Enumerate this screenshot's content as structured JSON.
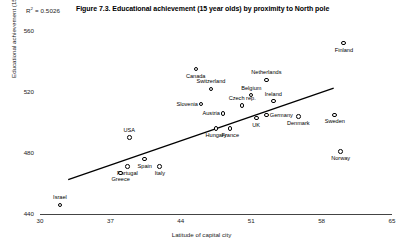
{
  "header": {
    "r2_prefix": "R",
    "r2_sup": "2",
    "r2_value": " = 0.5026",
    "title": "Figure 7.3. Educational achievement (15 year olds) by proximity to North pole"
  },
  "chart_data": {
    "type": "scatter",
    "title": "Figure 7.3. Educational achievement (15 year olds) by proximity to North pole",
    "xlabel": "Latitude of capital city",
    "ylabel": "Educational achievement (15 year olds)",
    "xlim": [
      30,
      65
    ],
    "ylim": [
      440,
      560
    ],
    "xticks": [
      "30",
      "37",
      "44",
      "51",
      "58",
      "65"
    ],
    "yticks": [
      "440",
      "480",
      "520",
      "560"
    ],
    "grid": false,
    "legend": "none",
    "annotations": [
      {
        "text": "R2 = 0.5026",
        "position": "top-left"
      }
    ],
    "trendline": {
      "visible": true,
      "x_start": 32.8,
      "y_start": 462.5,
      "x_end": 59.2,
      "y_end": 522.5
    },
    "points": [
      {
        "label": "Finland",
        "x": 60.2,
        "y": 552,
        "label_pos": "below"
      },
      {
        "label": "Canada",
        "x": 45.5,
        "y": 535,
        "label_pos": "below"
      },
      {
        "label": "Netherlands",
        "x": 52.5,
        "y": 528,
        "label_pos": "above"
      },
      {
        "label": "Switzerland",
        "x": 47.0,
        "y": 522,
        "label_pos": "above"
      },
      {
        "label": "Belgium",
        "x": 51.0,
        "y": 518,
        "label_pos": "above"
      },
      {
        "label": "Ireland",
        "x": 53.2,
        "y": 514,
        "label_pos": "above"
      },
      {
        "label": "Slovenia",
        "x": 46.0,
        "y": 512,
        "label_pos": "left"
      },
      {
        "label": "Czech rep.",
        "x": 50.1,
        "y": 511,
        "label_pos": "above"
      },
      {
        "label": "Austria",
        "x": 48.2,
        "y": 506,
        "label_pos": "left"
      },
      {
        "label": "Germany",
        "x": 52.5,
        "y": 505,
        "label_pos": "right"
      },
      {
        "label": "Sweden",
        "x": 59.3,
        "y": 505,
        "label_pos": "below"
      },
      {
        "label": "Denmark",
        "x": 55.7,
        "y": 504,
        "label_pos": "below"
      },
      {
        "label": "UK",
        "x": 51.5,
        "y": 503,
        "label_pos": "below"
      },
      {
        "label": "Hungary",
        "x": 47.5,
        "y": 496,
        "label_pos": "below"
      },
      {
        "label": "France",
        "x": 48.9,
        "y": 496,
        "label_pos": "below"
      },
      {
        "label": "USA",
        "x": 38.9,
        "y": 490,
        "label_pos": "above"
      },
      {
        "label": "Norway",
        "x": 59.9,
        "y": 481,
        "label_pos": "below"
      },
      {
        "label": "Spain",
        "x": 40.4,
        "y": 476,
        "label_pos": "below"
      },
      {
        "label": "Italy",
        "x": 41.9,
        "y": 471,
        "label_pos": "below"
      },
      {
        "label": "Portugal",
        "x": 38.7,
        "y": 471,
        "label_pos": "below"
      },
      {
        "label": "Greece",
        "x": 38.0,
        "y": 467,
        "label_pos": "below"
      },
      {
        "label": "Israel",
        "x": 32.0,
        "y": 446,
        "label_pos": "above"
      }
    ]
  }
}
